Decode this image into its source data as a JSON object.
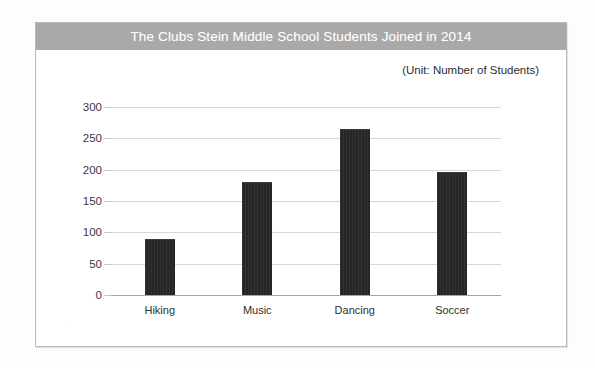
{
  "chart_data": {
    "type": "bar",
    "title": "The Clubs Stein Middle School Students Joined in 2014",
    "subtitle": "(Unit: Number of Students)",
    "categories": [
      "Hiking",
      "Music",
      "Dancing",
      "Soccer"
    ],
    "values": [
      90,
      180,
      265,
      197
    ],
    "xlabel": "",
    "ylabel": "",
    "ylim": [
      0,
      300
    ],
    "ytick_labels": [
      "0",
      "50",
      "100",
      "150",
      "200",
      "250",
      "300"
    ],
    "ytick_values": [
      0,
      50,
      100,
      150,
      200,
      250,
      300
    ],
    "grid": true,
    "legend": false,
    "colors": {
      "bar": "#262626",
      "title_bar": "#a9a9a9",
      "title_text": "#ffffff",
      "gridline": "#d7d7d7",
      "axis": "#a6a6a6",
      "card_border": "#b9b9b9",
      "background": "#ffffff"
    }
  }
}
